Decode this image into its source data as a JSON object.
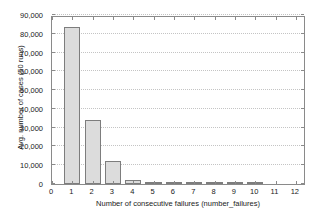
{
  "chart_data": {
    "type": "bar",
    "title": "",
    "xlabel": "Number of consecutive failures (number_failures)",
    "ylabel": "Avg. number of cases (50 runs)",
    "categories": [
      1,
      2,
      3,
      4,
      5,
      6,
      7,
      8,
      9,
      10,
      11,
      12
    ],
    "values": [
      83500,
      34000,
      12000,
      2200,
      450,
      90,
      20,
      5,
      2,
      1,
      0,
      0
    ],
    "series": [
      {
        "name": "Avg. number of cases (50 runs)",
        "values": [
          83500,
          34000,
          12000,
          2200,
          450,
          90,
          20,
          5,
          2,
          1,
          0,
          0
        ]
      }
    ],
    "xlim": [
      0,
      12.5
    ],
    "ylim": [
      0,
      90000
    ],
    "xticks": [
      0,
      1,
      2,
      3,
      4,
      5,
      6,
      7,
      8,
      9,
      10,
      11,
      12
    ],
    "xtick_labels": [
      "0",
      "1",
      "2",
      "3",
      "4",
      "5",
      "6",
      "7",
      "8",
      "9",
      "10",
      "11",
      "12"
    ],
    "yticks": [
      0,
      10000,
      20000,
      30000,
      40000,
      50000,
      60000,
      70000,
      80000,
      90000
    ],
    "ytick_labels": [
      "0",
      "10,000",
      "20,000",
      "30,000",
      "40,000",
      "50,000",
      "60,000",
      "70,000",
      "80,000",
      "90,000"
    ],
    "grid": {
      "horizontal": true,
      "vertical": false,
      "style": "dotted",
      "color": "#c4c4c4"
    },
    "legend": {
      "visible": false,
      "position": "none",
      "entries": []
    },
    "bar_style": {
      "fill_color": "#dcdcdc",
      "edge_color": "#7d7d7d",
      "width_fraction": 0.8
    },
    "axis_color": "#8a8a8a",
    "background_color": "#ffffff",
    "annotations": []
  }
}
